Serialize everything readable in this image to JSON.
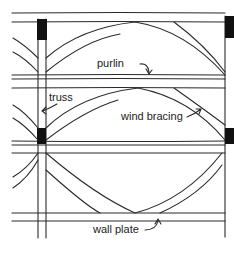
{
  "diagram": {
    "type": "roof framing plan (purlins, trusses, wind bracing)",
    "labels": {
      "purlin": "purlin",
      "truss": "truss",
      "wind_bracing": "wind bracing",
      "wall_plate": "wall plate"
    },
    "colors": {
      "line": "#2a2a2a",
      "block": "#111111",
      "background": "#ffffff"
    }
  }
}
